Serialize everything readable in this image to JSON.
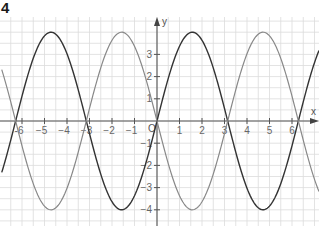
{
  "exercise_number": "4",
  "chart_data": {
    "type": "line",
    "title": "",
    "xlabel": "x",
    "ylabel": "y",
    "xlim": [
      -6.9,
      7.2
    ],
    "ylim": [
      -4.8,
      4.7
    ],
    "grid": true,
    "grid_minor_step": 0.5,
    "x_ticks": [
      -6,
      -5,
      -4,
      -3,
      -2,
      -1,
      1,
      2,
      3,
      4,
      5,
      6
    ],
    "x_tick_labels": [
      "-6",
      "−5",
      "−4",
      "−3",
      "−2",
      "−1",
      "1",
      "2",
      "3",
      "4",
      "5",
      "6"
    ],
    "y_ticks": [
      -4,
      -3,
      -2,
      -1,
      1,
      2,
      3
    ],
    "y_tick_labels": [
      "−4",
      "−3",
      "−2",
      "−1",
      "1",
      "2",
      "3"
    ],
    "origin_label": "O",
    "legend": null,
    "series": [
      {
        "name": "y = 4 sin x",
        "color": "#333333",
        "stroke_width": 1.4,
        "formula": "4*sin(x)",
        "x": [
          -6.9,
          -6.28,
          -4.71,
          -3.14,
          -1.57,
          0,
          1.57,
          3.14,
          4.71,
          6.28,
          7.2
        ],
        "values": [
          -2.32,
          0,
          4,
          0,
          -4,
          0,
          4,
          0,
          -4,
          0,
          3.17
        ]
      },
      {
        "name": "y = -4 sin x",
        "color": "#888888",
        "stroke_width": 1.2,
        "formula": "-4*sin(x)",
        "x": [
          -6.9,
          -6.28,
          -4.71,
          -3.14,
          -1.57,
          0,
          1.57,
          3.14,
          4.71,
          6.28,
          7.2
        ],
        "values": [
          2.32,
          0,
          -4,
          0,
          4,
          0,
          -4,
          0,
          4,
          0,
          -3.17
        ]
      }
    ]
  },
  "layout": {
    "origin_px": [
      157,
      121
    ],
    "unit_px_x": 22.5,
    "unit_px_y": 22.2,
    "plot_top": 17,
    "plot_bottom": 226,
    "plot_left": 0,
    "plot_right": 319
  }
}
